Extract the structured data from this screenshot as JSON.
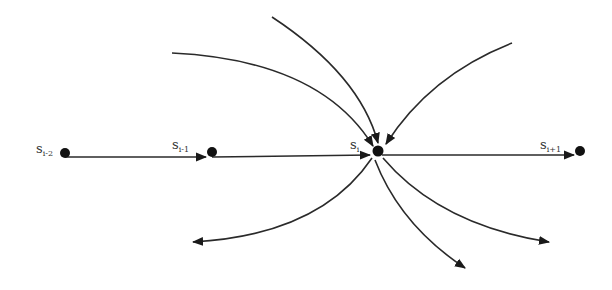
{
  "diagram": {
    "type": "state-transition",
    "colors": {
      "line": "#2a2a2a",
      "node": "#111111",
      "label": "#333333",
      "background": "#ffffff"
    },
    "nodes": [
      {
        "id": "s_i-2",
        "label": "s",
        "subscript": "i-2",
        "x": 65,
        "y": 153
      },
      {
        "id": "s_i-1",
        "label": "s",
        "subscript": "i-1",
        "x": 212,
        "y": 152
      },
      {
        "id": "s_i",
        "label": "s",
        "subscript": "i",
        "x": 378,
        "y": 151
      },
      {
        "id": "s_i+1",
        "label": "s",
        "subscript": "i+1",
        "x": 580,
        "y": 151
      }
    ],
    "main_chain": [
      {
        "from": "s_i-2",
        "to": "s_i-1"
      },
      {
        "from": "s_i-1",
        "to": "s_i"
      },
      {
        "from": "s_i",
        "to": "s_i+1"
      }
    ],
    "incoming_to_s_i": [
      {
        "from": "upper-left (far)",
        "start": [
          172,
          53
        ]
      },
      {
        "from": "top",
        "start": [
          272,
          17
        ]
      },
      {
        "from": "upper-right",
        "start": [
          512,
          43
        ]
      }
    ],
    "outgoing_from_s_i": [
      {
        "to": "lower-left",
        "end": [
          193,
          242
        ]
      },
      {
        "to": "bottom",
        "end": [
          465,
          268
        ]
      },
      {
        "to": "lower-right",
        "end": [
          549,
          242
        ]
      }
    ]
  }
}
